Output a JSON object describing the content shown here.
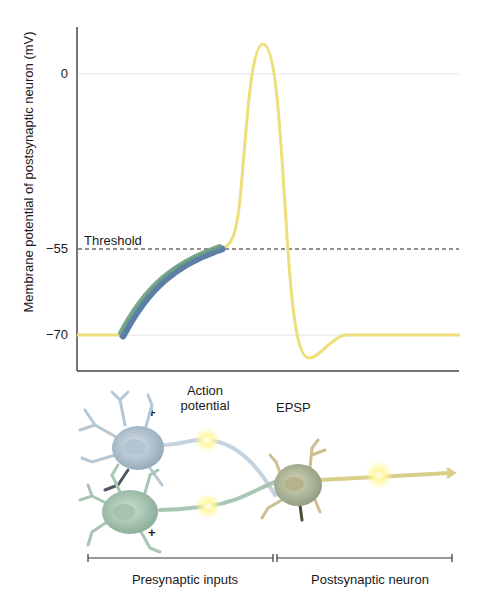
{
  "chart_data": {
    "type": "line",
    "title": "",
    "xlabel": "",
    "ylabel": "Membrane potential of postsynaptic neuron (mV)",
    "yticks": [
      0,
      -55,
      -70
    ],
    "ylim": [
      -75,
      10
    ],
    "threshold": {
      "label": "Threshold",
      "value": -55,
      "style": "dashed"
    },
    "series": [
      {
        "name": "EPSP (summed presynaptic inputs)",
        "color": "#5b8ea0",
        "points": [
          [
            0.12,
            -70
          ],
          [
            0.18,
            -62
          ],
          [
            0.25,
            -58
          ],
          [
            0.38,
            -55
          ]
        ]
      },
      {
        "name": "Action potential",
        "color": "#eedf7a",
        "points": [
          [
            0,
            -70
          ],
          [
            0.12,
            -70
          ],
          [
            0.38,
            -55
          ],
          [
            0.45,
            -35
          ],
          [
            0.49,
            5
          ],
          [
            0.52,
            -20
          ],
          [
            0.56,
            -70
          ],
          [
            0.6,
            -74
          ],
          [
            0.66,
            -70
          ],
          [
            1.0,
            -70
          ]
        ]
      }
    ],
    "grid": true
  },
  "axis": {
    "ylabel": "Membrane potential of postsynaptic neuron (mV)",
    "ticks": [
      "0",
      "−55",
      "−70"
    ],
    "threshold_label": "Threshold"
  },
  "diagram": {
    "action_potential_label": "Action potential",
    "epsp_label": "EPSP",
    "plus_top": "+",
    "plus_bottom": "+",
    "presynaptic_label": "Presynaptic inputs",
    "postsynaptic_label": "Postsynaptic neuron"
  },
  "colors": {
    "ap_trace": "#eedf7a",
    "epsp_blue": "#5b7fa8",
    "epsp_green": "#6a9e82",
    "neuron_blue": "#c6d6e0",
    "neuron_green": "#b6d1c0",
    "neuron_post": "#c9cfae",
    "axon_post": "#d8cf8a",
    "glow": "#fff59a"
  }
}
